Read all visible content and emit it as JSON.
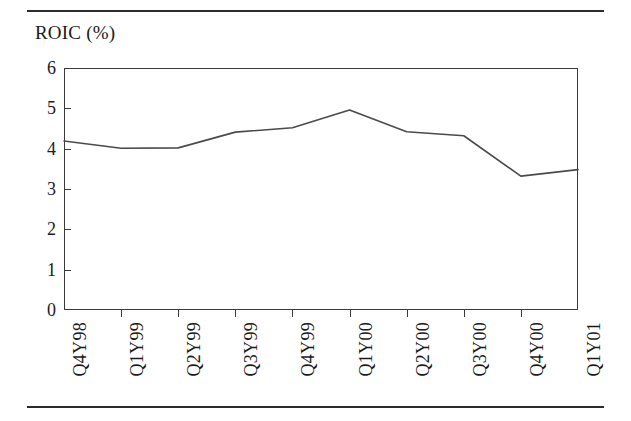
{
  "figure": {
    "axis_title": "ROIC (%)",
    "line_color": "#4a4a4a",
    "frame_color": "#3a3a3a",
    "rule_color": "#2b2b2b"
  },
  "chart_data": {
    "type": "line",
    "title": "ROIC (%)",
    "xlabel": "",
    "ylabel": "ROIC (%)",
    "ylim": [
      0,
      6
    ],
    "ytick_labels": [
      "6",
      "5",
      "4",
      "3",
      "2",
      "1",
      "0"
    ],
    "ytick_values": [
      6,
      5,
      4,
      3,
      2,
      1,
      0
    ],
    "grid": false,
    "legend": "none",
    "categories": [
      "Q4Y98",
      "Q1Y99",
      "Q2Y99",
      "Q3Y99",
      "Q4Y99",
      "Q1Y00",
      "Q2Y00",
      "Q3Y00",
      "Q4Y00",
      "Q1Y01"
    ],
    "values": [
      4.19,
      4.01,
      4.02,
      4.41,
      4.52,
      4.96,
      4.42,
      4.32,
      3.32,
      3.48
    ],
    "series": [
      {
        "name": "ROIC (%)",
        "values": [
          4.19,
          4.01,
          4.02,
          4.41,
          4.52,
          4.96,
          4.42,
          4.32,
          3.32,
          3.48
        ]
      }
    ]
  }
}
